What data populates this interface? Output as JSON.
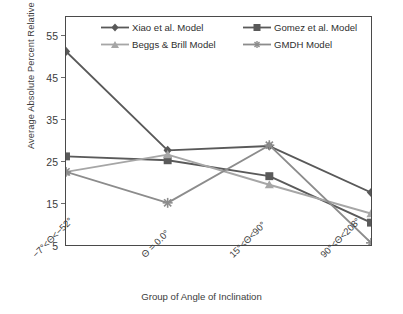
{
  "chart_data": {
    "type": "line",
    "title": "",
    "xlabel": "Group of Angle of Inclination",
    "ylabel": "Average Absolute Percent Relative Error (%)",
    "categories": [
      "−7°<Θ<−52°",
      "Θ = 0.0°",
      "15°<Θ<90°",
      "90°<Θ<208°"
    ],
    "ylim": [
      5,
      58
    ],
    "yticks": [
      5,
      15,
      25,
      35,
      45,
      55
    ],
    "grid": false,
    "legend_position": "top-inside",
    "series": [
      {
        "name": "Xiao et al. Model",
        "values": [
          50.0,
          27.0,
          28.0,
          17.2
        ],
        "color": "#595959",
        "marker": "diamond"
      },
      {
        "name": "Gomez et al. Model",
        "values": [
          25.6,
          24.7,
          21.0,
          10.2
        ],
        "color": "#5a5a5a",
        "marker": "square"
      },
      {
        "name": "Beggs & Brill Model",
        "values": [
          22.0,
          26.0,
          19.0,
          12.3
        ],
        "color": "#a6a6a6",
        "marker": "triangle"
      },
      {
        "name": "GMDH Model",
        "values": [
          22.0,
          14.8,
          28.2,
          5.5
        ],
        "color": "#8c8c8c",
        "marker": "star"
      }
    ]
  },
  "axis": {
    "y_title": "Average Absolute Percent Relative Error (%)",
    "x_title": "Group of Angle of Inclination",
    "y_tick_labels": [
      "55",
      "45",
      "35",
      "25",
      "15",
      "5"
    ]
  },
  "legend": {
    "items": [
      {
        "label": "Xiao et al. Model"
      },
      {
        "label": "Gomez et al. Model"
      },
      {
        "label": "Beggs & Brill Model"
      },
      {
        "label": "GMDH Model"
      }
    ]
  }
}
